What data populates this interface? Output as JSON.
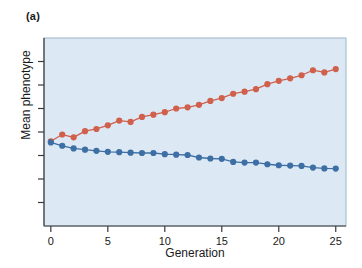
{
  "figure": {
    "panel_label": "(a)",
    "background_color": "#ffffff"
  },
  "chart_data": {
    "type": "line",
    "title": "",
    "subtitle": "",
    "xlabel": "Generation",
    "ylabel": "Mean phenotype",
    "xlim": [
      -0.6,
      25.9
    ],
    "ylim": [
      0.0,
      1.12
    ],
    "xticks": [
      0,
      5,
      10,
      15,
      20,
      25
    ],
    "xtick_labels": [
      "0",
      "5",
      "10",
      "15",
      "20",
      "25"
    ],
    "yticks": [
      0.14,
      0.28,
      0.42,
      0.56,
      0.7,
      0.84,
      0.98
    ],
    "ytick_labels": [
      "",
      "",
      "",
      "",
      "",
      "",
      ""
    ],
    "grid": false,
    "legend": null,
    "legend_position": "none",
    "plot_background_color": "#dce9f4",
    "frame_color": "#9fb4c6",
    "x": [
      0,
      1,
      2,
      3,
      4,
      5,
      6,
      7,
      8,
      9,
      10,
      11,
      12,
      13,
      14,
      15,
      16,
      17,
      18,
      19,
      20,
      21,
      22,
      23,
      24,
      25
    ],
    "series": [
      {
        "name": "upward-selected line",
        "color": "#d0604c",
        "marker": "circle",
        "values": [
          0.505,
          0.545,
          0.528,
          0.565,
          0.578,
          0.6,
          0.628,
          0.62,
          0.65,
          0.663,
          0.678,
          0.7,
          0.707,
          0.722,
          0.745,
          0.762,
          0.788,
          0.8,
          0.815,
          0.845,
          0.865,
          0.88,
          0.898,
          0.928,
          0.915,
          0.935
        ]
      },
      {
        "name": "downward-selected line",
        "color": "#3d6fa5",
        "marker": "circle",
        "values": [
          0.498,
          0.478,
          0.462,
          0.455,
          0.448,
          0.442,
          0.44,
          0.437,
          0.435,
          0.435,
          0.428,
          0.425,
          0.423,
          0.408,
          0.402,
          0.4,
          0.382,
          0.378,
          0.378,
          0.368,
          0.362,
          0.36,
          0.358,
          0.348,
          0.343,
          0.342
        ]
      }
    ]
  },
  "axis": {
    "x_axis_name": "generation-axis",
    "y_axis_name": "mean-phenotype-axis"
  }
}
